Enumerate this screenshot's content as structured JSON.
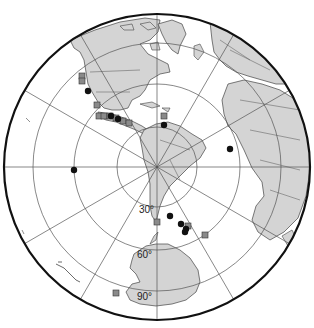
{
  "map": {
    "projection": "south-polar azimuthal",
    "land_color": "#d4d4d4",
    "ocean_color": "#ffffff",
    "border_color": "#444444",
    "grid_color": "#555555",
    "latitude_labels": [
      {
        "text": "30°",
        "x": 139,
        "y": 211
      },
      {
        "text": "60°",
        "x": 137,
        "y": 255
      },
      {
        "text": "90°",
        "x": 137,
        "y": 298
      }
    ],
    "legend": {
      "circle_marker": "black circle",
      "square_marker": "grey square"
    }
  },
  "markers": {
    "circles": [
      {
        "x": 88,
        "y": 91
      },
      {
        "x": 74,
        "y": 170
      },
      {
        "x": 164,
        "y": 125
      },
      {
        "x": 230,
        "y": 149
      },
      {
        "x": 170,
        "y": 216
      },
      {
        "x": 181,
        "y": 224
      },
      {
        "x": 186,
        "y": 229
      },
      {
        "x": 185,
        "y": 232
      },
      {
        "x": 111,
        "y": 116
      },
      {
        "x": 118,
        "y": 119
      }
    ],
    "squares": [
      {
        "x": 82,
        "y": 76
      },
      {
        "x": 82,
        "y": 81
      },
      {
        "x": 97,
        "y": 105
      },
      {
        "x": 99,
        "y": 116
      },
      {
        "x": 104,
        "y": 116
      },
      {
        "x": 110,
        "y": 116
      },
      {
        "x": 116,
        "y": 118
      },
      {
        "x": 123,
        "y": 121
      },
      {
        "x": 129,
        "y": 123
      },
      {
        "x": 164,
        "y": 116
      },
      {
        "x": 188,
        "y": 226
      },
      {
        "x": 205,
        "y": 235
      },
      {
        "x": 116,
        "y": 293
      },
      {
        "x": 157,
        "y": 222
      }
    ]
  }
}
